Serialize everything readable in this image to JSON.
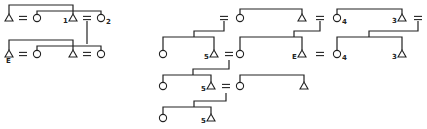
{
  "diagram": {
    "left": {
      "labels": {
        "a": "1",
        "b": "2",
        "c": "E"
      }
    },
    "right": {
      "labels": {
        "a": "4",
        "b": "3",
        "c": "5",
        "d": "E",
        "e": "4",
        "f": "3",
        "g": "5",
        "h": "5"
      }
    },
    "symbols": {
      "male": "triangle",
      "female": "circle",
      "marriage": "equals"
    },
    "colors": {
      "ink": "#222222",
      "background": "#ffffff"
    }
  }
}
